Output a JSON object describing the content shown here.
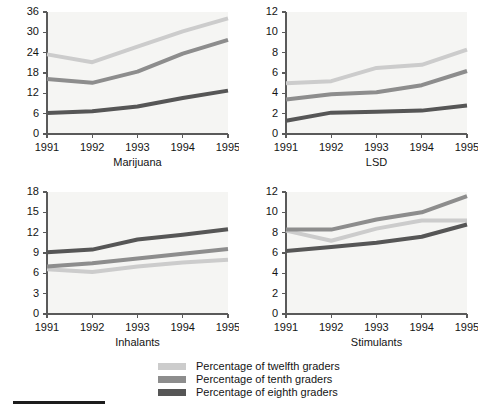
{
  "legend": {
    "entries": [
      {
        "label": "Percentage of twelfth graders",
        "color": "#cccccc",
        "series_key": "twelfth"
      },
      {
        "label": "Percentage of tenth graders",
        "color": "#8d8d8d",
        "series_key": "tenth"
      },
      {
        "label": "Percentage of eighth graders",
        "color": "#565656",
        "series_key": "eighth"
      }
    ]
  },
  "footer": {
    "rule_color": "#1c1c1c"
  },
  "colors": {
    "twelfth": "#cccccc",
    "tenth": "#8d8d8d",
    "eighth": "#565656",
    "axis": "#5a5a5a",
    "plot_background": "#f5f5f3",
    "text": "#141414"
  },
  "chart_data": [
    {
      "type": "line",
      "title": "Marijuana",
      "xlabel": "",
      "ylabel": "",
      "x": [
        "1991",
        "1992",
        "1993",
        "1994",
        "1995"
      ],
      "xtick_labels": [
        "1991",
        "1992",
        "1993",
        "1994",
        "1995"
      ],
      "ytick_labels": [
        "0",
        "6",
        "12",
        "18",
        "24",
        "30",
        "36"
      ],
      "yticks": [
        0,
        6,
        12,
        18,
        24,
        30,
        36
      ],
      "ylim": [
        0,
        36
      ],
      "grid": false,
      "legend_position": "below-figure",
      "series": [
        {
          "name": "Percentage of twelfth graders",
          "key": "twelfth",
          "color": "#cccccc",
          "values": [
            23.5,
            21.2,
            25.8,
            30.3,
            34.1
          ]
        },
        {
          "name": "Percentage of tenth graders",
          "key": "tenth",
          "color": "#8d8d8d",
          "values": [
            16.2,
            15.1,
            18.4,
            23.7,
            27.8
          ]
        },
        {
          "name": "Percentage of eighth graders",
          "key": "eighth",
          "color": "#565656",
          "values": [
            6.2,
            6.7,
            8.1,
            10.6,
            12.8
          ]
        }
      ]
    },
    {
      "type": "line",
      "title": "LSD",
      "xlabel": "",
      "ylabel": "",
      "x": [
        "1991",
        "1992",
        "1993",
        "1994",
        "1995"
      ],
      "xtick_labels": [
        "1991",
        "1992",
        "1993",
        "1994",
        "1995"
      ],
      "ytick_labels": [
        "0",
        "2",
        "4",
        "6",
        "8",
        "10",
        "12"
      ],
      "yticks": [
        0,
        2,
        4,
        6,
        8,
        10,
        12
      ],
      "ylim": [
        0,
        12
      ],
      "grid": false,
      "legend_position": "below-figure",
      "series": [
        {
          "name": "Percentage of twelfth graders",
          "key": "twelfth",
          "color": "#cccccc",
          "values": [
            5.0,
            5.2,
            6.5,
            6.8,
            8.3
          ]
        },
        {
          "name": "Percentage of tenth graders",
          "key": "tenth",
          "color": "#8d8d8d",
          "values": [
            3.4,
            3.9,
            4.1,
            4.8,
            6.2
          ]
        },
        {
          "name": "Percentage of eighth graders",
          "key": "eighth",
          "color": "#565656",
          "values": [
            1.3,
            2.1,
            2.2,
            2.3,
            2.8
          ]
        }
      ]
    },
    {
      "type": "line",
      "title": "Inhalants",
      "xlabel": "",
      "ylabel": "",
      "x": [
        "1991",
        "1992",
        "1993",
        "1994",
        "1995"
      ],
      "xtick_labels": [
        "1991",
        "1992",
        "1993",
        "1994",
        "1995"
      ],
      "ytick_labels": [
        "0",
        "3",
        "6",
        "9",
        "12",
        "15",
        "18"
      ],
      "yticks": [
        0,
        3,
        6,
        9,
        12,
        15,
        18
      ],
      "ylim": [
        0,
        18
      ],
      "grid": false,
      "legend_position": "below-figure",
      "series": [
        {
          "name": "Percentage of twelfth graders",
          "key": "twelfth",
          "color": "#cccccc",
          "values": [
            6.6,
            6.2,
            7.0,
            7.6,
            8.0
          ]
        },
        {
          "name": "Percentage of tenth graders",
          "key": "tenth",
          "color": "#8d8d8d",
          "values": [
            7.0,
            7.5,
            8.2,
            8.9,
            9.6
          ]
        },
        {
          "name": "Percentage of eighth graders",
          "key": "eighth",
          "color": "#565656",
          "values": [
            9.1,
            9.5,
            11.0,
            11.7,
            12.5
          ]
        }
      ]
    },
    {
      "type": "line",
      "title": "Stimulants",
      "xlabel": "",
      "ylabel": "",
      "x": [
        "1991",
        "1992",
        "1993",
        "1994",
        "1995"
      ],
      "xtick_labels": [
        "1991",
        "1992",
        "1993",
        "1994",
        "1995"
      ],
      "ytick_labels": [
        "0",
        "2",
        "4",
        "6",
        "8",
        "10",
        "12"
      ],
      "yticks": [
        0,
        2,
        4,
        6,
        8,
        10,
        12
      ],
      "ylim": [
        0,
        12
      ],
      "grid": false,
      "legend_position": "below-figure",
      "series": [
        {
          "name": "Percentage of twelfth graders",
          "key": "twelfth",
          "color": "#cccccc",
          "values": [
            8.2,
            7.2,
            8.4,
            9.2,
            9.2
          ]
        },
        {
          "name": "Percentage of tenth graders",
          "key": "tenth",
          "color": "#8d8d8d",
          "values": [
            8.3,
            8.3,
            9.3,
            10.0,
            11.6
          ]
        },
        {
          "name": "Percentage of eighth graders",
          "key": "eighth",
          "color": "#565656",
          "values": [
            6.2,
            6.6,
            7.0,
            7.6,
            8.8
          ]
        }
      ]
    }
  ]
}
